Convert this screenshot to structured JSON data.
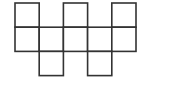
{
  "diagram": {
    "type": "net-of-squares",
    "width": 177,
    "height": 86,
    "origin": [
      15,
      3
    ],
    "cell_size": 24.2,
    "stroke": "#333333",
    "stroke_width": 1.6,
    "fill": "#ffffff",
    "squares": [
      {
        "row": 0,
        "col": 0
      },
      {
        "row": 0,
        "col": 2
      },
      {
        "row": 0,
        "col": 4
      },
      {
        "row": 1,
        "col": 0
      },
      {
        "row": 1,
        "col": 1
      },
      {
        "row": 1,
        "col": 2
      },
      {
        "row": 1,
        "col": 3
      },
      {
        "row": 1,
        "col": 4
      },
      {
        "row": 2,
        "col": 1
      },
      {
        "row": 2,
        "col": 3
      }
    ]
  }
}
